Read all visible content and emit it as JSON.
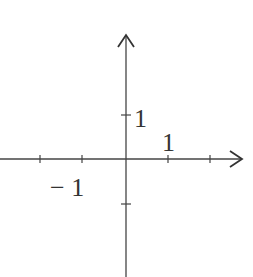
{
  "diagram": {
    "type": "coordinate-axes",
    "colors": {
      "axis": "#444444",
      "text": "#333333",
      "background": "#ffffff"
    },
    "labels": {
      "y_unit": "1",
      "x_unit": "1",
      "x_neg_unit": "− 1"
    },
    "origin_px": [
      126,
      159
    ],
    "unit_px": 42,
    "x_ticks": [
      -2,
      -1,
      1,
      2
    ],
    "y_ticks": [
      1,
      -1
    ]
  }
}
